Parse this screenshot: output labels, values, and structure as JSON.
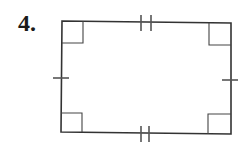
{
  "problem": {
    "number_label": "4."
  },
  "figure": {
    "shape": "rectangle",
    "stroke_color": "#333333",
    "tick_color": "#555555",
    "vertices": {
      "top_left": [
        62,
        21
      ],
      "top_right": [
        231,
        23
      ],
      "bottom_right": [
        231,
        134
      ],
      "bottom_left": [
        61,
        132
      ]
    },
    "right_angle_marks": 4,
    "side_marks": {
      "top": "double tick",
      "bottom": "double tick",
      "left": "single tick",
      "right": "single tick"
    }
  }
}
